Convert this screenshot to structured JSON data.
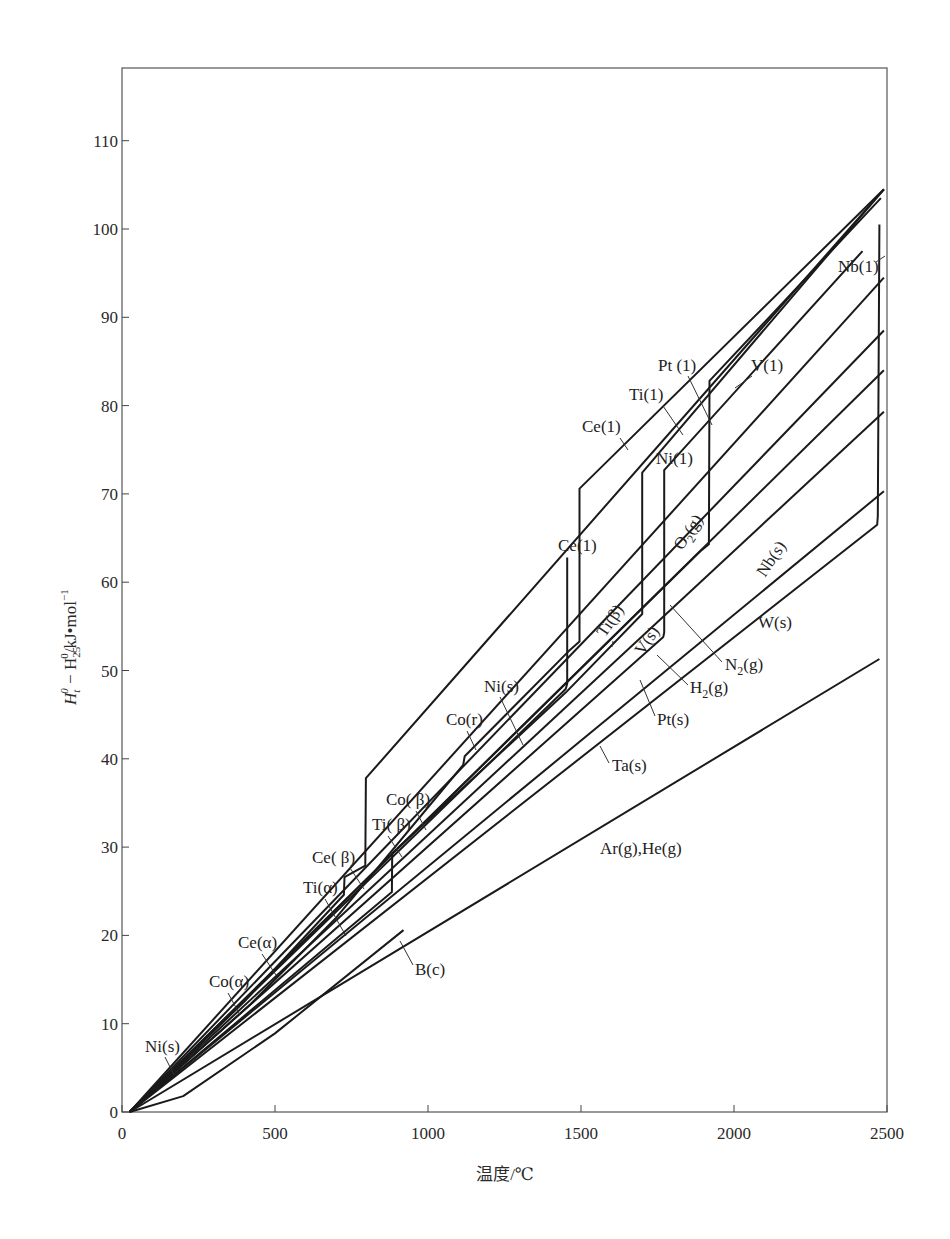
{
  "chart_data": {
    "type": "line",
    "title": "",
    "xlabel": "温度/℃",
    "ylabel": "H_t^0 − H_25^0 / kJ·mol^-1",
    "xlim": [
      0,
      2500
    ],
    "ylim": [
      0,
      117
    ],
    "x_ticks": [
      0,
      500,
      1000,
      1500,
      2000,
      2500
    ],
    "y_ticks": [
      0,
      10,
      20,
      30,
      40,
      50,
      60,
      70,
      80,
      90,
      100,
      110
    ],
    "grid": false,
    "legend": "inline labels with leader lines",
    "series": [
      {
        "name": "Ce",
        "labels": [
          "Ce(α)",
          "Ce(β)",
          "Ce(1)"
        ],
        "points": [
          [
            25,
            0
          ],
          [
            400,
            12.5
          ],
          [
            725,
            24.6
          ],
          [
            727,
            26.6
          ],
          [
            795,
            27.9
          ],
          [
            797,
            37.8
          ],
          [
            2490,
            104.5
          ]
        ]
      },
      {
        "name": "Co",
        "labels": [
          "Co(α)",
          "Co(β)",
          "Co(r)",
          "Ce(1) upper"
        ],
        "points": [
          [
            25,
            0
          ],
          [
            420,
            12.2
          ],
          [
            700,
            22
          ],
          [
            1115,
            39.3
          ],
          [
            1120,
            40.3
          ],
          [
            1460,
            52.2
          ],
          [
            1495,
            53.3
          ],
          [
            1495,
            70.6
          ],
          [
            2490,
            104.5
          ]
        ]
      },
      {
        "name": "Ti",
        "labels": [
          "Ti(α)",
          "Ti(β)",
          "Ti(1)"
        ],
        "points": [
          [
            25,
            0
          ],
          [
            882,
            24.9
          ],
          [
            883,
            29.3
          ],
          [
            1450,
            47.5
          ],
          [
            1700,
            56.4
          ],
          [
            1700,
            72.4
          ],
          [
            2490,
            104.5
          ]
        ]
      },
      {
        "name": "Ni",
        "labels": [
          "Ni(s)",
          "Ni(1)"
        ],
        "points": [
          [
            25,
            0
          ],
          [
            1450,
            47.9
          ],
          [
            1455,
            48.5
          ],
          [
            1455,
            62.8
          ]
        ]
      },
      {
        "name": "Pt",
        "labels": [
          "Pt(s)",
          "Pt(1)"
        ],
        "points": [
          [
            25,
            0
          ],
          [
            1769,
            53.8
          ],
          [
            1772,
            54.3
          ],
          [
            1772,
            72.7
          ],
          [
            2420,
            97.5
          ]
        ]
      },
      {
        "name": "V",
        "labels": [
          "V(s)",
          "V(1)"
        ],
        "points": [
          [
            25,
            0
          ],
          [
            1890,
            63.5
          ],
          [
            1918,
            64.3
          ],
          [
            1920,
            82.8
          ],
          [
            2480,
            103.5
          ]
        ]
      },
      {
        "name": "Nb",
        "labels": [
          "Nb(s)",
          "Nb(1)"
        ],
        "points": [
          [
            25,
            0
          ],
          [
            2468,
            66.5
          ],
          [
            2470,
            67.5
          ],
          [
            2475,
            100.5
          ]
        ]
      },
      {
        "name": "O2(g)",
        "labels": [
          "O2(g)"
        ],
        "points": [
          [
            25,
            0
          ],
          [
            2490,
            94.5
          ]
        ]
      },
      {
        "name": "N2(g)",
        "labels": [
          "N2(g)"
        ],
        "points": [
          [
            25,
            0
          ],
          [
            2490,
            88.5
          ]
        ]
      },
      {
        "name": "H2(g)",
        "labels": [
          "H2(g)"
        ],
        "points": [
          [
            25,
            0
          ],
          [
            2490,
            84
          ]
        ]
      },
      {
        "name": "Ta(s)",
        "labels": [
          "Ta(s)"
        ],
        "points": [
          [
            25,
            0
          ],
          [
            2490,
            79.3
          ]
        ]
      },
      {
        "name": "W(s)",
        "labels": [
          "W(s)"
        ],
        "points": [
          [
            25,
            0
          ],
          [
            2490,
            70.3
          ]
        ]
      },
      {
        "name": "B(c)",
        "labels": [
          "B(c)"
        ],
        "points": [
          [
            25,
            0
          ],
          [
            200,
            1.8
          ],
          [
            500,
            8.9
          ],
          [
            920,
            20.6
          ]
        ]
      },
      {
        "name": "Ar(g), He(g)",
        "labels": [
          "Ar(g),He(g)"
        ],
        "points": [
          [
            25,
            0
          ],
          [
            2475,
            51.3
          ]
        ]
      }
    ]
  },
  "axes": {
    "x_tick_labels": [
      "0",
      "500",
      "1000",
      "1500",
      "2000",
      "2500"
    ],
    "y_tick_labels": [
      "0",
      "10",
      "20",
      "30",
      "40",
      "50",
      "60",
      "70",
      "80",
      "90",
      "100",
      "110"
    ],
    "xlabel": "温度/℃",
    "ylabel_main": "H",
    "ylabel_sub1": "t",
    "ylabel_sup1": "0",
    "ylabel_mid": " − H",
    "ylabel_sub2": "25",
    "ylabel_sup2": "0",
    "ylabel_unit": "/kJ•mol",
    "ylabel_unit_sup": "−1"
  },
  "labels": {
    "nb_l": "Nb(1)",
    "v_l": "V(1)",
    "pt_l": "Pt (1)",
    "ti_l": "Ti(1)",
    "ce_l_upper": "Ce(1)",
    "ni_l": "Ni(1)",
    "ce_l": "Ce(1)",
    "o2": "O",
    "o2_sub": "2",
    "o2_tail": "(g)",
    "nb_s": "Nb(s)",
    "w_s": "W(s)",
    "ti_beta_hi": "Ti(β)",
    "v_s": "V(s)",
    "n2": "N",
    "n2_sub": "2",
    "n2_tail": "(g)",
    "h2": "H",
    "h2_sub": "2",
    "h2_tail": "(g)",
    "pt_s": "Pt(s)",
    "ta_s": "Ta(s)",
    "ni_s_mid": "Ni(s)",
    "co_r": "Co(r)",
    "co_beta": "Co( β)",
    "ti_beta": "Ti( β)",
    "ce_beta": "Ce( β)",
    "ti_alpha": "Ti(α)",
    "ce_alpha": "Ce(α)",
    "co_alpha": "Co(α)",
    "ni_s_low": "Ni(s)",
    "b_c": "B(c)",
    "ar_he": "Ar(g),He(g)"
  }
}
